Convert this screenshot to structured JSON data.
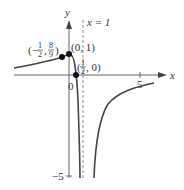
{
  "figure": {
    "axes": {
      "x_label": "x",
      "y_label": "y",
      "origin_label": "0",
      "x_tick_label": "5",
      "y_tick_label": "−5"
    },
    "asymptote": {
      "label": "x = 1"
    },
    "points": [
      {
        "label_open": "(−",
        "num": "1",
        "den": "2",
        "sep": ",",
        "num2": "8",
        "den2": "9",
        "label_close": ")"
      },
      {
        "label": "(0, 1)"
      },
      {
        "label_open": "(",
        "num": "1",
        "den": "2",
        "label_close": ", 0)"
      }
    ],
    "colors": {
      "curve": "#444444",
      "axis": "#555555",
      "point": "#111111"
    }
  }
}
